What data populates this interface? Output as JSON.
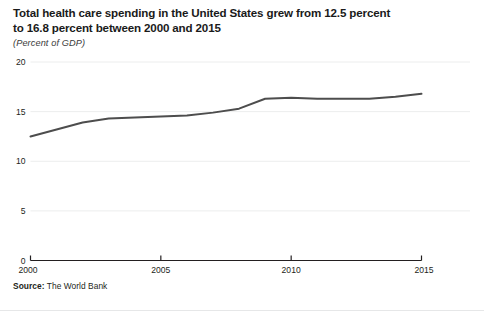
{
  "figure": {
    "title_line1": "Total health care spending in the United States grew from 12.5 percent",
    "title_line2": "to 16.8 percent between 2000 and 2015",
    "subtitle": "(Percent of GDP)",
    "source_label": "Source:",
    "source_value": " The World Bank",
    "line_color": "#4d4d4d",
    "grid_color": "#eceded",
    "axis_color": "#231f20",
    "background": "#ffffff"
  },
  "chart_data": {
    "type": "line",
    "title": "Total health care spending in the United States grew from 12.5 percent to 16.8 percent between 2000 and 2015",
    "subtitle": "(Percent of GDP)",
    "xlabel": "",
    "ylabel": "Percent of GDP",
    "xlim": [
      2000,
      2015
    ],
    "ylim": [
      0,
      20
    ],
    "grid": true,
    "legend": "none",
    "x_ticks": [
      2000,
      2005,
      2010,
      2015
    ],
    "x_tick_labels": [
      "2000",
      "2005",
      "2010",
      "2015"
    ],
    "y_ticks": [
      0,
      5,
      10,
      15,
      20
    ],
    "y_tick_labels": [
      "0",
      "5",
      "10",
      "15",
      "20"
    ],
    "x": [
      2000,
      2001,
      2002,
      2003,
      2004,
      2005,
      2006,
      2007,
      2008,
      2009,
      2010,
      2011,
      2012,
      2013,
      2014,
      2015
    ],
    "series": [
      {
        "name": "Total health care spending",
        "values": [
          12.5,
          13.2,
          13.9,
          14.3,
          14.4,
          14.5,
          14.6,
          14.9,
          15.3,
          16.3,
          16.4,
          16.3,
          16.3,
          16.3,
          16.5,
          16.8
        ]
      }
    ],
    "annotations": [],
    "source": "Source: The World Bank"
  }
}
